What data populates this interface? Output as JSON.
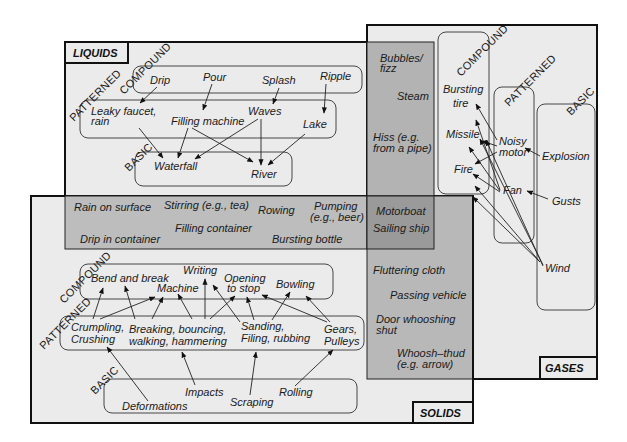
{
  "colors": {
    "panel_bg": "#ebebeb",
    "overlap_light": "#bdbdbd",
    "overlap_mid": "#aeaeae",
    "overlap_dark": "#9a9a9a",
    "border": "#111111"
  },
  "panels": {
    "liquids": {
      "title": "LIQUIDS"
    },
    "gases": {
      "title": "GASES"
    },
    "solids": {
      "title": "SOLIDS"
    }
  },
  "tiers": {
    "liquids": {
      "compound": "COMPOUND",
      "patterned": "PATTERNED",
      "basic": "BASIC"
    },
    "gases": {
      "compound": "COMPOUND",
      "patterned": "PATTERNED",
      "basic": "BASIC"
    },
    "solids": {
      "compound": "COMPOUND",
      "patterned": "PATTERNED",
      "basic": "BASIC"
    }
  },
  "liquids": {
    "compound": [
      "Drip",
      "Pour",
      "Splash",
      "Ripple"
    ],
    "patterned": [
      "Leaky faucet,",
      "rain",
      "Filling machine",
      "Waves",
      "Lake"
    ],
    "basic": [
      "Waterfall",
      "River"
    ]
  },
  "liquid_gas": [
    "Bubbles/",
    "fizz",
    "Steam",
    "Hiss (e.g.",
    "from a pipe)"
  ],
  "liquid_solid": [
    "Rain on surface",
    "Stirring (e.g., tea)",
    "Rowing",
    "Pumping",
    "(e.g., beer)",
    "Filling container",
    "Drip in container",
    "Bursting bottle"
  ],
  "all_three": [
    "Motorboat",
    "Sailing ship"
  ],
  "gas_solid": [
    "Fluttering cloth",
    "Passing vehicle",
    "Door whooshing",
    "shut",
    "Whoosh–thud",
    "(e.g. arrow)"
  ],
  "gases": {
    "compound": [
      "Bursting",
      "tire",
      "Missile",
      "Fire"
    ],
    "patterned": [
      "Noisy",
      "motor",
      "Fan"
    ],
    "basic": [
      "Explosion",
      "Gusts",
      "Wind"
    ]
  },
  "solids": {
    "compound": [
      "Bend and break",
      "Writing",
      "Machine",
      "Opening",
      "to stop",
      "Bowling"
    ],
    "patterned": [
      "Crumpling,",
      "Crushing",
      "Breaking, bouncing,",
      "walking, hammering",
      "Sanding,",
      "Filing, rubbing",
      "Gears,",
      "Pulleys"
    ],
    "basic": [
      "Impacts",
      "Deformations",
      "Scraping",
      "Rolling"
    ]
  }
}
